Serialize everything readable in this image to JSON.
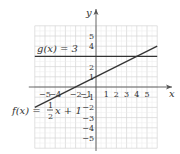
{
  "chart_data": {
    "type": "line",
    "title": "",
    "xlabel": "x",
    "ylabel": "y",
    "xlim": [
      -6,
      6
    ],
    "ylim": [
      -6,
      6
    ],
    "grid": true,
    "x_ticks": [
      -5,
      -4,
      -2,
      -1,
      1,
      2,
      3,
      4,
      5
    ],
    "x_tick_labels": [
      "−5",
      "−4",
      "−2",
      "−1",
      "1",
      "2",
      "3",
      "4",
      "5"
    ],
    "y_ticks": [
      5,
      4,
      2,
      1,
      -1,
      -2,
      -3,
      -4,
      -5
    ],
    "y_tick_labels": [
      "5",
      "4",
      "2",
      "1",
      "−1",
      "−2",
      "−3",
      "−4",
      "−5"
    ],
    "series": [
      {
        "name": "g(x) = 3",
        "equation": "g(x) = 3",
        "x": [
          -6,
          6
        ],
        "y": [
          3,
          3
        ],
        "color": "#333333"
      },
      {
        "name": "f(x) = 1/2 x + 1",
        "equation": "f(x) = ½x + 1",
        "x": [
          -6,
          6
        ],
        "y": [
          -2,
          4
        ],
        "color": "#333333"
      }
    ],
    "annotations": [
      {
        "text": "g(x) = 3",
        "near": [
          -4,
          3.5
        ]
      },
      {
        "text": "f(x) = ½x + 1",
        "near": [
          -5,
          -2.5
        ]
      }
    ]
  },
  "labels": {
    "x_axis": "x",
    "y_axis": "y",
    "g_label": "g(x) = 3",
    "f_prefix": "f(x) = ",
    "f_num": "1",
    "f_den": "2",
    "f_suffix": "x + 1"
  }
}
